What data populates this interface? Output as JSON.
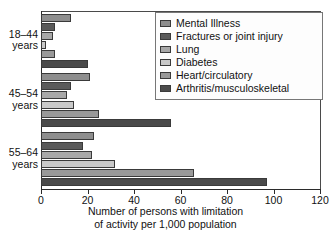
{
  "chart_data": {
    "type": "bar",
    "orientation": "horizontal",
    "title": "",
    "xlabel": "Number of persons with limitation of activity per 1,000 population",
    "ylabel": "",
    "xlim": [
      0,
      120
    ],
    "xticks": [
      0,
      20,
      40,
      60,
      80,
      100,
      120
    ],
    "grid": false,
    "legend_position": "top-right",
    "categories": [
      "18–44 years",
      "45–54 years",
      "55–64 years"
    ],
    "series": [
      {
        "name": "Mental Illness",
        "color": "#8e8e8e",
        "values": [
          13,
          21,
          23
        ]
      },
      {
        "name": "Fractures or joint injury",
        "color": "#5a5a5a",
        "values": [
          6,
          13,
          18
        ]
      },
      {
        "name": "Lung",
        "color": "#a8a8a8",
        "values": [
          5,
          11,
          22
        ]
      },
      {
        "name": "Diabetes",
        "color": "#c9c9c9",
        "values": [
          2,
          14,
          32
        ]
      },
      {
        "name": "Heart/circulatory",
        "color": "#999999",
        "values": [
          6,
          25,
          66
        ]
      },
      {
        "name": "Arthritis/musculoskeletal",
        "color": "#4a4a4a",
        "values": [
          20,
          56,
          97
        ]
      }
    ]
  },
  "axis": {
    "tick_labels": [
      "0",
      "20",
      "40",
      "60",
      "80",
      "100",
      "120"
    ],
    "title_line1": "Number of persons with limitation",
    "title_line2": "of activity per 1,000 population"
  },
  "groups": [
    {
      "line1": "18–44",
      "line2": "years"
    },
    {
      "line1": "45–54",
      "line2": "years"
    },
    {
      "line1": "55–64",
      "line2": "years"
    }
  ],
  "legend": {
    "items": [
      {
        "label": "Mental Illness"
      },
      {
        "label": "Fractures or joint injury"
      },
      {
        "label": "Lung"
      },
      {
        "label": "Diabetes"
      },
      {
        "label": "Heart/circulatory"
      },
      {
        "label": "Arthritis/musculoskeletal"
      }
    ]
  }
}
